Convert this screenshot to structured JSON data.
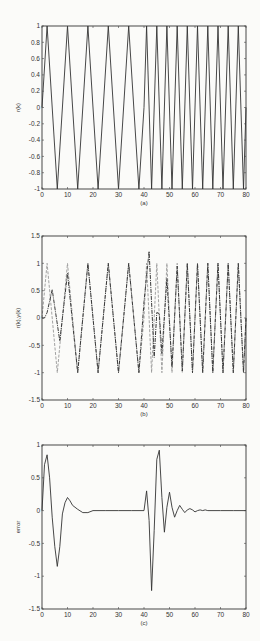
{
  "chart_data": [
    {
      "id": "a",
      "type": "line",
      "title": "",
      "xlabel": "(a)",
      "ylabel": "r(k)",
      "xlim": [
        0,
        80
      ],
      "ylim": [
        -1,
        1
      ],
      "xticks": [
        0,
        10,
        20,
        30,
        40,
        50,
        60,
        70,
        80
      ],
      "yticks": [
        -1,
        -0.8,
        -0.6,
        -0.4,
        -0.2,
        0,
        0.2,
        0.4,
        0.6,
        0.8,
        1
      ],
      "ytick_labels": [
        "-1",
        "-0.8",
        "-0.6",
        "-0.4",
        "-0.2",
        "0",
        "0.2",
        "0.4",
        "0.6",
        "0.8",
        "1"
      ],
      "grid": false,
      "series": [
        {
          "name": "r(k)",
          "style": "solid",
          "description": "sin(2*pi*k/8) for k<40, sin(2*pi*k/4) for k>=40",
          "x": [
            0,
            2,
            6,
            10,
            14,
            18,
            22,
            26,
            30,
            34,
            38,
            40,
            41,
            43,
            45,
            47,
            49,
            51,
            53,
            55,
            57,
            59,
            61,
            63,
            65,
            67,
            69,
            71,
            73,
            75,
            77,
            79,
            80
          ],
          "y": [
            0,
            1,
            -1,
            1,
            -1,
            1,
            -1,
            1,
            -1,
            1,
            -1,
            0,
            1,
            -1,
            1,
            -1,
            1,
            -1,
            1,
            -1,
            1,
            -1,
            1,
            -1,
            1,
            -1,
            1,
            -1,
            1,
            -1,
            1,
            -1,
            0
          ]
        }
      ]
    },
    {
      "id": "b",
      "type": "line",
      "title": "",
      "xlabel": "(b)",
      "ylabel": "r(k),y(k)",
      "xlim": [
        0,
        80
      ],
      "ylim": [
        -1.5,
        1.5
      ],
      "xticks": [
        0,
        10,
        20,
        30,
        40,
        50,
        60,
        70,
        80
      ],
      "yticks": [
        -1.5,
        -1,
        -0.5,
        0,
        0.5,
        1,
        1.5
      ],
      "ytick_labels": [
        "-1.5",
        "-1",
        "-0.5",
        "0",
        "0.5",
        "1",
        "1.5"
      ],
      "grid": false,
      "series": [
        {
          "name": "r(k)",
          "style": "dashed-light",
          "x": [
            0,
            2,
            6,
            10,
            14,
            18,
            22,
            26,
            30,
            34,
            38,
            40,
            41,
            43,
            45,
            47,
            49,
            51,
            53,
            55,
            57,
            59,
            61,
            63,
            65,
            67,
            69,
            71,
            73,
            75,
            77,
            79,
            80
          ],
          "y": [
            0,
            1,
            -1,
            1,
            -1,
            1,
            -1,
            1,
            -1,
            1,
            -1,
            0,
            1,
            -1,
            1,
            -1,
            1,
            -1,
            1,
            -1,
            1,
            -1,
            1,
            -1,
            1,
            -1,
            1,
            -1,
            1,
            -1,
            1,
            -1,
            0
          ]
        },
        {
          "name": "y(k)",
          "style": "dashdot-dark",
          "x": [
            0,
            1,
            2,
            4,
            7,
            10,
            14,
            18,
            22,
            26,
            30,
            34,
            38,
            40,
            42,
            44,
            45,
            46,
            47,
            49,
            51,
            53,
            55,
            57,
            59,
            61,
            63,
            65,
            67,
            69,
            71,
            73,
            75,
            77,
            79,
            80
          ],
          "y": [
            0,
            0,
            0.1,
            0.52,
            -0.42,
            0.82,
            -1,
            1,
            -1,
            1,
            -1,
            1,
            -1,
            0.3,
            1.22,
            -0.72,
            0.1,
            0.08,
            -0.65,
            0.72,
            -0.9,
            0.95,
            -0.97,
            1,
            -1,
            1,
            -1,
            1,
            -1,
            1,
            -1,
            1,
            -1,
            1,
            -1,
            0
          ]
        }
      ]
    },
    {
      "id": "c",
      "type": "line",
      "title": "",
      "xlabel": "(c)",
      "ylabel": "error",
      "xlim": [
        0,
        80
      ],
      "ylim": [
        -1.5,
        1
      ],
      "xticks": [
        0,
        10,
        20,
        30,
        40,
        50,
        60,
        70,
        80
      ],
      "yticks": [
        -1.5,
        -1,
        -0.5,
        0,
        0.5,
        1
      ],
      "ytick_labels": [
        "-1.5",
        "-1",
        "-0.5",
        "0",
        "0.5",
        "1"
      ],
      "grid": false,
      "series": [
        {
          "name": "error",
          "style": "solid",
          "x": [
            0,
            1,
            2,
            3,
            4,
            5,
            6,
            7,
            8,
            9,
            10,
            11,
            12,
            14,
            16,
            18,
            20,
            25,
            30,
            35,
            40,
            41,
            42,
            43,
            44,
            45,
            46,
            47,
            48,
            49,
            50,
            51,
            52,
            53,
            54,
            55,
            56,
            57,
            58,
            59,
            60,
            61,
            62,
            63,
            64,
            65,
            70,
            75,
            80
          ],
          "y": [
            0,
            0.7,
            0.85,
            0.5,
            -0.1,
            -0.55,
            -0.85,
            -0.55,
            -0.05,
            0.12,
            0.2,
            0.15,
            0.08,
            0.02,
            -0.03,
            -0.03,
            0,
            0,
            0,
            0,
            0,
            0.3,
            -0.15,
            -1.22,
            -0.3,
            0.78,
            0.92,
            0.2,
            -0.33,
            0.05,
            0.28,
            0.05,
            -0.1,
            0,
            0.08,
            0.02,
            -0.03,
            0.01,
            0.03,
            0.01,
            -0.02,
            0,
            0.01,
            0,
            0.01,
            0,
            0,
            0,
            0
          ]
        }
      ]
    }
  ],
  "xtick_labels": [
    "0",
    "10",
    "20",
    "30",
    "40",
    "50",
    "60",
    "70",
    "80"
  ]
}
